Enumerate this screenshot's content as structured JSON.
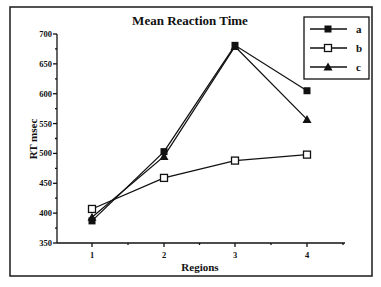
{
  "chart_data": {
    "type": "line",
    "title": "Mean Reaction Time",
    "xlabel": "Regions",
    "ylabel": "RT msec",
    "categories": [
      "1",
      "2",
      "3",
      "4"
    ],
    "x": [
      1,
      2,
      3,
      4
    ],
    "ylim": [
      350,
      700
    ],
    "yticks": [
      350,
      400,
      450,
      500,
      550,
      600,
      650,
      700
    ],
    "grid": false,
    "legend_position": "top-right",
    "series": [
      {
        "name": "a",
        "marker": "filled-square",
        "values": [
          387,
          503,
          681,
          605
        ]
      },
      {
        "name": "b",
        "marker": "open-square",
        "values": [
          407,
          459,
          488,
          498
        ]
      },
      {
        "name": "c",
        "marker": "filled-triangle",
        "values": [
          393,
          495,
          679,
          557
        ]
      }
    ]
  },
  "colors": {
    "line": "#111111",
    "background": "#ffffff"
  }
}
